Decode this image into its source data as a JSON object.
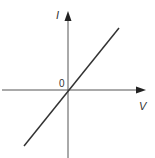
{
  "diagram": {
    "type": "I-V characteristic graph (ohmic conductor)",
    "y_axis_label": "I",
    "x_axis_label": "V",
    "origin_label": "0",
    "line": {
      "description": "straight line through origin with positive slope",
      "color": "#333333"
    },
    "axis_color": "#555555"
  }
}
